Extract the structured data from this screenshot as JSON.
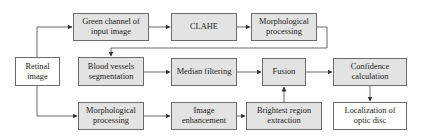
{
  "diagram": {
    "colors": {
      "process_fill": "#e3e3e3",
      "terminal_fill": "#ffffff",
      "stroke": "#6b6b6b",
      "text": "#222222"
    },
    "nodes": [
      {
        "id": "retinal",
        "label": "Retinal image",
        "fill": "white"
      },
      {
        "id": "green",
        "label": "Green channel of input image",
        "fill": "gray"
      },
      {
        "id": "clahe",
        "label": "CLAHE",
        "fill": "gray"
      },
      {
        "id": "morph1",
        "label": "Morphological processing",
        "fill": "gray"
      },
      {
        "id": "vessels",
        "label": "Blood vessels segmentation",
        "fill": "gray"
      },
      {
        "id": "median",
        "label": "Median filtering",
        "fill": "gray"
      },
      {
        "id": "fusion",
        "label": "Fusion",
        "fill": "gray"
      },
      {
        "id": "confidence",
        "label": "Confidence calculation",
        "fill": "gray"
      },
      {
        "id": "morph2",
        "label": "Morphological processing",
        "fill": "gray"
      },
      {
        "id": "enhance",
        "label": "Image enhancement",
        "fill": "gray"
      },
      {
        "id": "brightest",
        "label": "Brightest region extraction",
        "fill": "gray"
      },
      {
        "id": "localization",
        "label": "Localization of optic disc",
        "fill": "white"
      }
    ],
    "edges": [
      {
        "from": "retinal",
        "to": "green"
      },
      {
        "from": "green",
        "to": "clahe"
      },
      {
        "from": "clahe",
        "to": "morph1"
      },
      {
        "from": "morph1",
        "to": "vessels"
      },
      {
        "from": "vessels",
        "to": "median"
      },
      {
        "from": "median",
        "to": "fusion"
      },
      {
        "from": "fusion",
        "to": "confidence"
      },
      {
        "from": "confidence",
        "to": "localization"
      },
      {
        "from": "retinal",
        "to": "morph2"
      },
      {
        "from": "morph2",
        "to": "enhance"
      },
      {
        "from": "enhance",
        "to": "brightest"
      },
      {
        "from": "brightest",
        "to": "fusion"
      }
    ]
  }
}
